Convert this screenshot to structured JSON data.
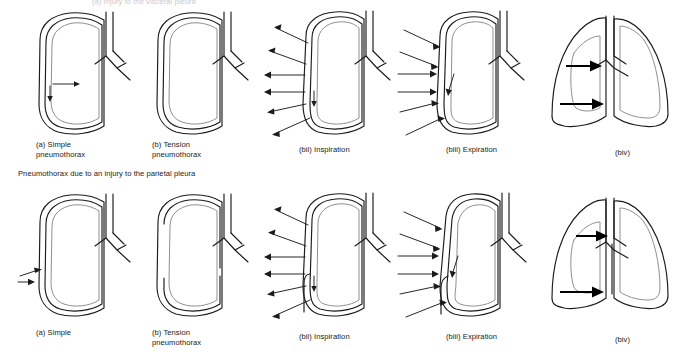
{
  "figure": {
    "width": 693,
    "height": 352,
    "background": "#ffffff",
    "stroke_chest": "#1b1b1b",
    "stroke_lung": "#8f8f93",
    "arrow_color": "#1b1b1b"
  },
  "headings": {
    "top": "(a) Injury to the visceral pleura",
    "middle": "Pneumothorax due to an injury to the parietal pleura"
  },
  "rows": [
    {
      "id": "row-visceral",
      "panels": [
        {
          "id": "r1-a",
          "caption": "(a) Simple\npneumothorax",
          "type": "single-lung"
        },
        {
          "id": "r1-b",
          "caption": "(b) Tension\npneumothorax",
          "type": "single-lung"
        },
        {
          "id": "r1-bii",
          "caption": "(bii) Inspiration",
          "type": "single-lung-arrows-out"
        },
        {
          "id": "r1-biii",
          "caption": "(biii) Expiration",
          "type": "single-lung-arrows-in"
        },
        {
          "id": "r1-biv",
          "caption": "(biv)",
          "type": "both-lungs-shift"
        }
      ]
    },
    {
      "id": "row-parietal",
      "panels": [
        {
          "id": "r2-a",
          "caption": "(a) Simple",
          "type": "single-lung"
        },
        {
          "id": "r2-b",
          "caption": "(b) Tension\npneumothorax",
          "type": "single-lung"
        },
        {
          "id": "r2-bii",
          "caption": "(bii) Inspiration",
          "type": "single-lung-arrows-out"
        },
        {
          "id": "r2-biii",
          "caption": "(biii) Expiration",
          "type": "single-lung-arrows-in"
        },
        {
          "id": "r2-biv",
          "caption": "(biv)",
          "type": "both-lungs-shift"
        }
      ]
    }
  ]
}
